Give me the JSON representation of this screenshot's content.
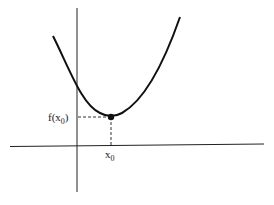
{
  "diagram": {
    "point_label_y": {
      "main": "f(x",
      "sub": "0",
      "close": ")"
    },
    "point_label_x": {
      "main": "x",
      "sub": "0"
    },
    "colors": {
      "curve": "#111111",
      "axes": "#222222",
      "dash": "#333333"
    }
  }
}
